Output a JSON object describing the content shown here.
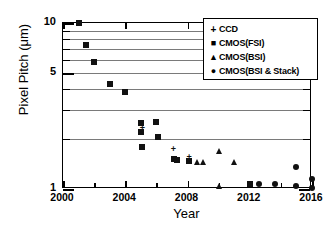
{
  "chart_data": {
    "type": "scatter",
    "title": "",
    "xlabel": "Year",
    "ylabel": "Pixel Pitch (μm)",
    "xlim": [
      2000,
      2016
    ],
    "ylim": [
      1,
      10
    ],
    "yscale": "log",
    "xticks": [
      "2000",
      "2004",
      "2008",
      "2012",
      "2016"
    ],
    "yticks": [
      "1",
      "5",
      "10"
    ],
    "ygridlines": [
      2,
      3,
      4,
      5,
      6,
      7,
      8,
      9
    ],
    "grid": true,
    "legend_position": "top-right",
    "series": [
      {
        "name": "CCD",
        "marker": "plus",
        "points": [
          {
            "x": 2005.1,
            "y": 2.32
          },
          {
            "x": 2007.1,
            "y": 1.75
          },
          {
            "x": 2008.1,
            "y": 1.55
          }
        ]
      },
      {
        "name": "CMOS(FSI)",
        "marker": "square",
        "points": [
          {
            "x": 2001.0,
            "y": 10.0
          },
          {
            "x": 2001.5,
            "y": 7.4
          },
          {
            "x": 2002.0,
            "y": 5.8
          },
          {
            "x": 2003.0,
            "y": 4.3
          },
          {
            "x": 2004.0,
            "y": 3.85
          },
          {
            "x": 2005.0,
            "y": 2.5
          },
          {
            "x": 2005.0,
            "y": 2.2
          },
          {
            "x": 2005.1,
            "y": 1.78
          },
          {
            "x": 2006.0,
            "y": 2.55
          },
          {
            "x": 2006.1,
            "y": 2.05
          },
          {
            "x": 2007.1,
            "y": 1.52
          },
          {
            "x": 2007.3,
            "y": 1.5
          },
          {
            "x": 2008.1,
            "y": 1.48
          },
          {
            "x": 2012.0,
            "y": 1.07
          }
        ]
      },
      {
        "name": "CMOS(BSI)",
        "marker": "triangle",
        "points": [
          {
            "x": 2008.6,
            "y": 1.45
          },
          {
            "x": 2009.0,
            "y": 1.45
          },
          {
            "x": 2010.0,
            "y": 1.7
          },
          {
            "x": 2010.0,
            "y": 1.05
          },
          {
            "x": 2011.0,
            "y": 1.45
          }
        ]
      },
      {
        "name": "CMOS(BSI & Stack)",
        "marker": "circle",
        "points": [
          {
            "x": 2012.6,
            "y": 1.07
          },
          {
            "x": 2013.6,
            "y": 1.07
          },
          {
            "x": 2015.0,
            "y": 1.35
          },
          {
            "x": 2015.0,
            "y": 1.05
          },
          {
            "x": 2016.0,
            "y": 1.15
          },
          {
            "x": 2016.0,
            "y": 1.02
          }
        ]
      }
    ]
  },
  "legend": {
    "items": [
      {
        "marker": "+",
        "label": "CCD"
      },
      {
        "marker": "■",
        "label": "CMOS(FSI)"
      },
      {
        "marker": "▲",
        "label": "CMOS(BSI)"
      },
      {
        "marker": "●",
        "label": "CMOS(BSI & Stack)"
      }
    ]
  },
  "colors": {
    "marker": "#111111",
    "axis": "#000000",
    "grid": "#7a7a7a",
    "background": "#ffffff"
  }
}
